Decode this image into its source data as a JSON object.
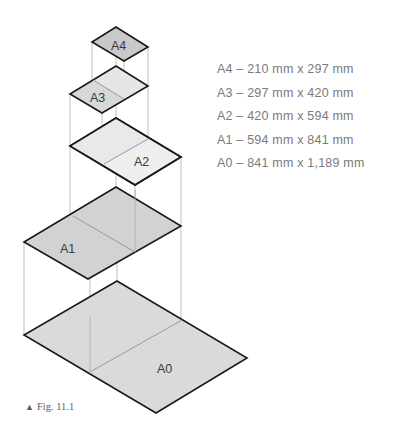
{
  "figure": {
    "caption_marker": "▲",
    "caption": "Fig. 11.1"
  },
  "sheets": [
    {
      "name": "A4",
      "label": "A4",
      "fill": "#c9c9c9"
    },
    {
      "name": "A3",
      "label": "A3",
      "fill": "#dcdcdc"
    },
    {
      "name": "A2",
      "label": "A2",
      "fill": "#efefef"
    },
    {
      "name": "A1",
      "label": "A1",
      "fill": "#d2d2d2"
    },
    {
      "name": "A0",
      "label": "A0",
      "fill": "#dadada"
    }
  ],
  "legend": [
    {
      "size": "A4",
      "text": "A4 – 210 mm x 297 mm"
    },
    {
      "size": "A3",
      "text": "A3 – 297 mm x 420 mm"
    },
    {
      "size": "A2",
      "text": "A2 – 420 mm x 594 mm"
    },
    {
      "size": "A1",
      "text": "A1 – 594 mm x 841 mm"
    },
    {
      "size": "A0",
      "text": "A0 – 841 mm x 1,189 mm"
    }
  ],
  "colors": {
    "outline": "#1a1a1a",
    "guide": "#b5b5b5",
    "divider": "#9a9a9a",
    "text": "#7a7a7a"
  }
}
